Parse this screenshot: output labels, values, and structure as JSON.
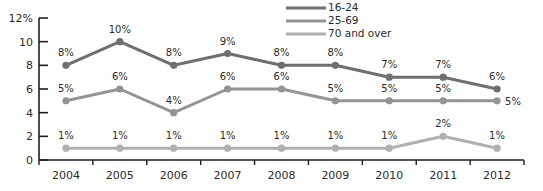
{
  "chart_data": {
    "type": "line",
    "title": "",
    "subtitle": "",
    "xlabel": "",
    "ylabel": "",
    "categories": [
      "2004",
      "2005",
      "2006",
      "2007",
      "2008",
      "2009",
      "2010",
      "2011",
      "2012"
    ],
    "ylim": [
      0,
      12
    ],
    "ytick_labels": [
      "0",
      "2",
      "4",
      "6",
      "8",
      "10",
      "12%"
    ],
    "ytick_values": [
      0,
      2,
      4,
      6,
      8,
      10,
      12
    ],
    "grid": false,
    "legend_position": "top-right",
    "series": [
      {
        "name": "16-24",
        "color": "#6f6f6f",
        "values": [
          8,
          10,
          8,
          9,
          8,
          8,
          7,
          7,
          6
        ],
        "labels": [
          "8%",
          "10%",
          "8%",
          "9%",
          "8%",
          "8%",
          "7%",
          "7%",
          "6%"
        ]
      },
      {
        "name": "25-69",
        "color": "#949494",
        "values": [
          5,
          6,
          4,
          6,
          6,
          5,
          5,
          5,
          5
        ],
        "labels": [
          "5%",
          "6%",
          "4%",
          "6%",
          "6%",
          "5%",
          "5%",
          "5%",
          "5%"
        ]
      },
      {
        "name": "70 and over",
        "color": "#b0b0b0",
        "values": [
          1,
          1,
          1,
          1,
          1,
          1,
          1,
          2,
          1
        ],
        "labels": [
          "1%",
          "1%",
          "1%",
          "1%",
          "1%",
          "1%",
          "1%",
          "2%",
          "1%"
        ]
      }
    ]
  },
  "legend": {
    "items": [
      {
        "label": "16-24",
        "color": "#6f6f6f"
      },
      {
        "label": "25-69",
        "color": "#949494"
      },
      {
        "label": "70 and over",
        "color": "#b0b0b0"
      }
    ]
  },
  "axis": {
    "color": "#1f1f1f"
  }
}
